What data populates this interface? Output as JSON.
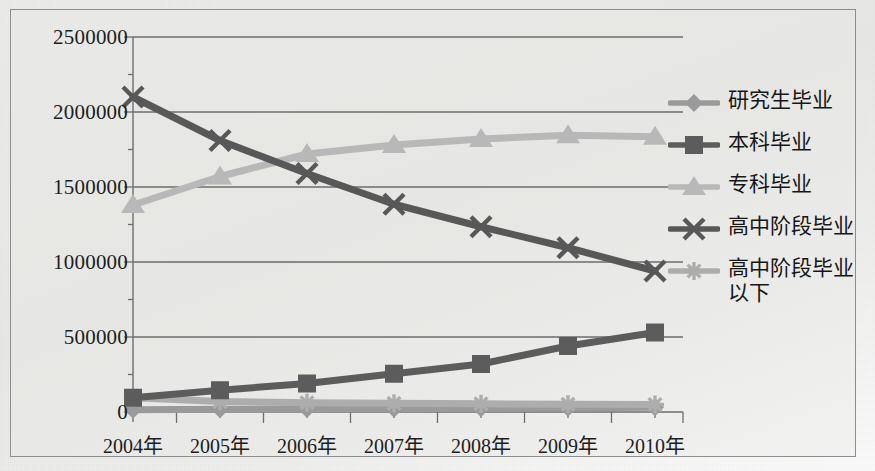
{
  "chart_data": {
    "type": "line",
    "title": "",
    "xlabel": "",
    "ylabel": "",
    "categories": [
      "2004年",
      "2005年",
      "2006年",
      "2007年",
      "2008年",
      "2009年",
      "2010年"
    ],
    "ylim": [
      0,
      2500000
    ],
    "ytick_labels": [
      "0",
      "500000",
      "1000000",
      "1500000",
      "2000000",
      "2500000"
    ],
    "ytick_values": [
      0,
      500000,
      1000000,
      1500000,
      2000000,
      2500000
    ],
    "grid": true,
    "legend_position": "right",
    "series": [
      {
        "name": "研究生毕业",
        "marker": "diamond",
        "color": "#9a9a9a",
        "values": [
          15000,
          18000,
          20000,
          22000,
          25000,
          28000,
          32000
        ]
      },
      {
        "name": "本科毕业",
        "marker": "square",
        "color": "#5c5c5c",
        "values": [
          95000,
          145000,
          190000,
          255000,
          320000,
          440000,
          530000
        ]
      },
      {
        "name": "专科毕业",
        "marker": "triangle",
        "color": "#b8b8b8",
        "values": [
          1380000,
          1570000,
          1720000,
          1780000,
          1820000,
          1845000,
          1835000
        ]
      },
      {
        "name": "高中阶段毕业",
        "marker": "x",
        "color": "#585858",
        "values": [
          2100000,
          1810000,
          1590000,
          1385000,
          1235000,
          1095000,
          940000
        ]
      },
      {
        "name": "高中阶段毕业以下",
        "marker": "asterisk",
        "color": "#adadad",
        "values": [
          95000,
          70000,
          62000,
          58000,
          55000,
          52000,
          50000
        ]
      }
    ]
  },
  "colors": {
    "background": "#ececeb",
    "frame_border": "#8d8d8d",
    "gridline": "#6d6d6d",
    "axis": "#6f6f6f",
    "text": "#1d1d1d"
  }
}
